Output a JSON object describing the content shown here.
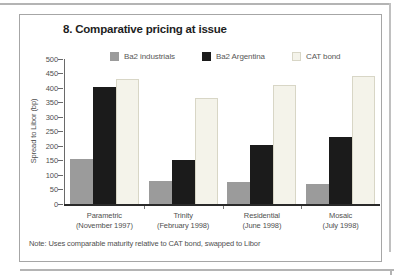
{
  "panel": {
    "title": "8. Comparative pricing at issue",
    "note": "Note: Uses comparable maturity relative to CAT bond, swapped to Libor"
  },
  "chart_data": {
    "type": "bar",
    "title": "8. Comparative pricing at issue",
    "ylabel": "Spread to Libor (bp)",
    "xlabel": "",
    "ylim": [
      0,
      500
    ],
    "ytick_step": 50,
    "grid": false,
    "legend_position": "top",
    "categories": [
      {
        "name": "Parametric",
        "date": "(November 1997)"
      },
      {
        "name": "Trinity",
        "date": "(February 1998)"
      },
      {
        "name": "Residential",
        "date": "(June 1998)"
      },
      {
        "name": "Mosaic",
        "date": "(July 1998)"
      }
    ],
    "series": [
      {
        "name": "Ba2 industrials",
        "color": "#9b9b9b",
        "border": "#9b9b9b",
        "values": [
          155,
          80,
          75,
          70
        ]
      },
      {
        "name": "Ba2 Argentina",
        "color": "#1b1b1b",
        "border": "#1b1b1b",
        "values": [
          405,
          150,
          205,
          230
        ]
      },
      {
        "name": "CAT bond",
        "color": "#f4f3ea",
        "border": "#d8d6c6",
        "values": [
          430,
          365,
          410,
          440
        ]
      }
    ]
  }
}
